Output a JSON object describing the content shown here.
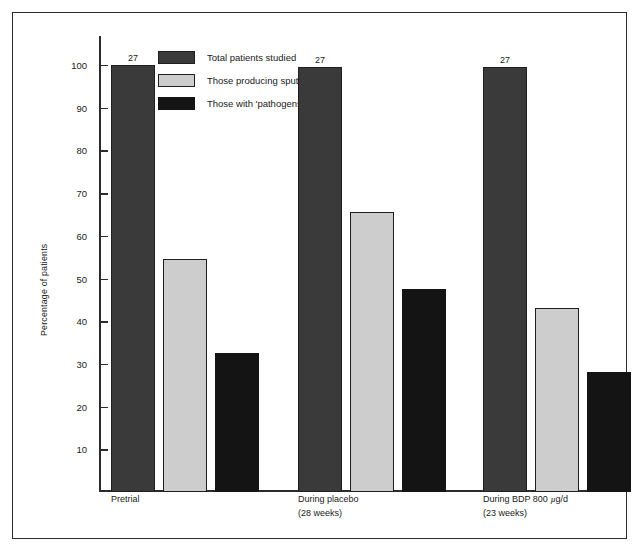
{
  "chart_data": {
    "type": "bar",
    "title": "",
    "xlabel": "",
    "ylabel": "Percentage of patients",
    "ylim": [
      0,
      104
    ],
    "grid": false,
    "legend_position": "top-left",
    "categories": [
      "Pretrial",
      "During placebo (28 weeks)",
      "During BDP 800 µg/d (23 weeks)"
    ],
    "category_lines": [
      {
        "line1": "Pretrial",
        "line2": ""
      },
      {
        "line1": "During placebo",
        "line2": "(28 weeks)"
      },
      {
        "line1": "During BDP 800 ",
        "mu": "µ",
        "line1b": "g/d",
        "line2": "(23 weeks)"
      }
    ],
    "y_ticks": [
      10,
      20,
      30,
      40,
      50,
      60,
      70,
      80,
      90,
      100
    ],
    "series": [
      {
        "name": "Total patients studied",
        "key": "total",
        "color": "#3a3a3a",
        "values": [
          100,
          99.5,
          99.5
        ]
      },
      {
        "name": "Those producing sputum",
        "key": "sputum",
        "color": "#cdcdcd",
        "values": [
          54.5,
          65.5,
          43
        ]
      },
      {
        "name": "Those with 'pathogens'",
        "key": "pathogen",
        "color": "#141414",
        "values": [
          32.5,
          47.5,
          28
        ]
      }
    ],
    "bar_annotations": [
      {
        "group": 0,
        "series": 0,
        "text": "27"
      },
      {
        "group": 1,
        "series": 0,
        "text": "27"
      },
      {
        "group": 2,
        "series": 0,
        "text": "27"
      }
    ]
  },
  "legend": {
    "items": [
      {
        "label": "Total patients studied",
        "swatch": "series-total"
      },
      {
        "label": "Those producing sputum",
        "swatch": "series-sputum"
      },
      {
        "label": "Those with 'pathogens'",
        "swatch": "series-pathogen"
      }
    ]
  },
  "axis": {
    "y_title": "Percentage of patients"
  }
}
